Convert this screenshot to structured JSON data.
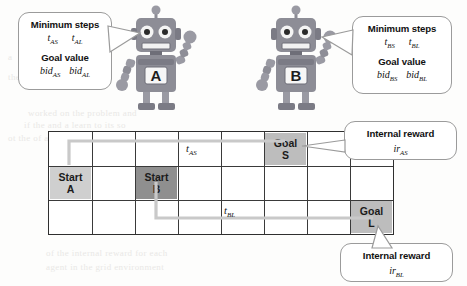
{
  "callouts": {
    "agent_a": {
      "name": "minimum-steps-goal-value-a",
      "header1": "Minimum steps",
      "vars1": [
        {
          "base": "t",
          "sub": "AS"
        },
        {
          "base": "t",
          "sub": "AL"
        }
      ],
      "header2": "Goal value",
      "vars2": [
        {
          "base": "bid",
          "sub": "AS"
        },
        {
          "base": "bid",
          "sub": "AL"
        }
      ]
    },
    "agent_b": {
      "name": "minimum-steps-goal-value-b",
      "header1": "Minimum steps",
      "vars1": [
        {
          "base": "t",
          "sub": "BS"
        },
        {
          "base": "t",
          "sub": "BL"
        }
      ],
      "header2": "Goal value",
      "vars2": [
        {
          "base": "bid",
          "sub": "BS"
        },
        {
          "base": "bid",
          "sub": "BL"
        }
      ]
    },
    "reward_s": {
      "name": "internal-reward-as",
      "header1": "Internal reward",
      "vars1": [
        {
          "base": "ir",
          "sub": "AS"
        }
      ]
    },
    "reward_l": {
      "name": "internal-reward-bl",
      "header1": "Internal reward",
      "vars1": [
        {
          "base": "ir",
          "sub": "BL"
        }
      ]
    }
  },
  "robots": [
    {
      "id": "robot-a",
      "label": "A",
      "body_color": "#8d8d96",
      "accent_color": "#6e6e78"
    },
    {
      "id": "robot-b",
      "label": "B",
      "body_color": "#8d8d96",
      "accent_color": "#6e6e78"
    }
  ],
  "grid": {
    "columns": 8,
    "rows": 3,
    "border_color": "#2f2f2f",
    "cells": [
      {
        "key": "start_a",
        "col": 0,
        "row": 1,
        "line1": "Start",
        "line2": "A",
        "shade": "light"
      },
      {
        "key": "start_b",
        "col": 2,
        "row": 1,
        "line1": "Start",
        "line2": "B",
        "shade": "dark"
      },
      {
        "key": "goal_s",
        "col": 5,
        "row": 0,
        "line1": "Goal",
        "line2": "S",
        "shade": "mid"
      },
      {
        "key": "goal_l",
        "col": 7,
        "row": 2,
        "line1": "Goal",
        "line2": "L",
        "shade": "mid"
      }
    ],
    "path_labels": [
      {
        "key": "t_as",
        "base": "t",
        "sub": "AS",
        "col": 3,
        "row": 0
      },
      {
        "key": "t_bl",
        "base": "t",
        "sub": "BL",
        "col": 4,
        "row": 2
      }
    ],
    "paths": [
      {
        "key": "path-a-to-s",
        "color": "#c9c9c9",
        "from": "Start A",
        "to": "Goal S"
      },
      {
        "key": "path-b-to-l",
        "color": "#c9c9c9",
        "from": "Start B",
        "to": "Goal L"
      }
    ]
  },
  "background_ghost_text": [
    {
      "t": "worked  on  the  problem  and",
      "x": 28,
      "y": 108
    },
    {
      "t": "if the   and  a  learn  to  its   so",
      "x": 24,
      "y": 120
    },
    {
      "t": "ot     the  of    and",
      "x": 8,
      "y": 133
    },
    {
      "t": "some   of   the  agent  is  its  on   a",
      "x": 52,
      "y": 156
    },
    {
      "t": "it is   a   known   to  equal   to",
      "x": 100,
      "y": 170
    },
    {
      "t": "the   as    a   value   of   the   goal",
      "x": 60,
      "y": 198
    },
    {
      "t": "in   it   and    a   state   which   the",
      "x": 56,
      "y": 214
    },
    {
      "t": "of    the   internal   reward   for   each",
      "x": 46,
      "y": 248
    },
    {
      "t": "agent   in   the   grid   environment",
      "x": 46,
      "y": 262
    },
    {
      "t": "a",
      "x": 8,
      "y": 52
    },
    {
      "t": "the",
      "x": 8,
      "y": 72
    }
  ]
}
